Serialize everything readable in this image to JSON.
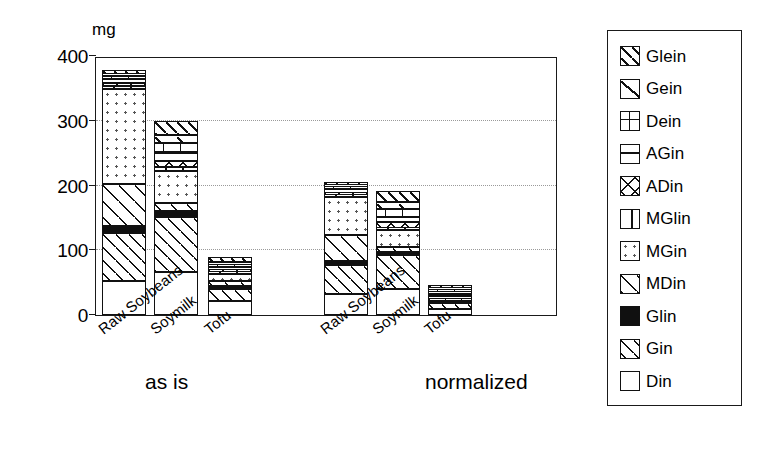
{
  "chart_data": {
    "type": "bar",
    "subtype": "stacked",
    "title": "",
    "xlabel": "",
    "ylabel": "mg",
    "ylim": [
      0,
      400
    ],
    "yticks": [
      0,
      100,
      200,
      300,
      400
    ],
    "ytick_labels": [
      "0",
      "100",
      "200",
      "300",
      "400"
    ],
    "grid": "horizontal-dotted",
    "legend_position": "right-outside",
    "groups": [
      {
        "label": "as is",
        "categories": [
          "Raw Soybeans",
          "Soymilk",
          "Tofu"
        ]
      },
      {
        "label": "normalized",
        "categories": [
          "Raw Soybeans",
          "Soymilk",
          "Tofu"
        ]
      }
    ],
    "categories": [
      "Raw Soybeans",
      "Soymilk",
      "Tofu",
      "Raw Soybeans",
      "Soymilk",
      "Tofu"
    ],
    "series": [
      {
        "name": "Din",
        "pattern": "blank",
        "values": [
          53,
          66,
          22,
          32,
          40,
          10
        ]
      },
      {
        "name": "Gin",
        "pattern": "diagonal-hatch-fine",
        "values": [
          73,
          86,
          18,
          45,
          52,
          8
        ]
      },
      {
        "name": "Glin",
        "pattern": "solid-black",
        "values": [
          11,
          9,
          5,
          7,
          6,
          3
        ]
      },
      {
        "name": "MDin",
        "pattern": "diagonal-hatch",
        "values": [
          66,
          12,
          7,
          40,
          7,
          4
        ]
      },
      {
        "name": "MGin",
        "pattern": "dotted",
        "values": [
          146,
          49,
          12,
          58,
          26,
          5
        ]
      },
      {
        "name": "MGlin",
        "pattern": "vertical-bar",
        "values": [
          5,
          6,
          2,
          3,
          4,
          1
        ]
      },
      {
        "name": "ADin",
        "pattern": "cross-diagonal",
        "values": [
          4,
          10,
          3,
          4,
          8,
          2
        ]
      },
      {
        "name": "AGin",
        "pattern": "horizontal-lines",
        "values": [
          6,
          12,
          5,
          5,
          9,
          3
        ]
      },
      {
        "name": "Dein",
        "pattern": "grid",
        "values": [
          5,
          16,
          4,
          4,
          12,
          3
        ]
      },
      {
        "name": "Gein",
        "pattern": "single-diagonal",
        "values": [
          3,
          12,
          4,
          3,
          10,
          3
        ]
      },
      {
        "name": "Glein",
        "pattern": "diagonal-hatch-bold",
        "values": [
          6,
          22,
          7,
          5,
          17,
          5
        ]
      }
    ],
    "totals": [
      378,
      300,
      89,
      206,
      191,
      47
    ]
  },
  "axes": {
    "unit_label": "mg",
    "ytick_labels": [
      "400",
      "300",
      "200",
      "100",
      "0"
    ]
  },
  "xaxis": {
    "tick_labels": [
      "Raw Soybeans",
      "Soymilk",
      "Tofu",
      "Raw Soybeans",
      "Soymilk",
      "Tofu"
    ],
    "group_labels": [
      "as is",
      "normalized"
    ]
  },
  "legend": {
    "entries": [
      {
        "label": "Glein",
        "swatch": "diagonal-hatch-bold-swatch"
      },
      {
        "label": "Gein",
        "swatch": "single-diagonal-swatch"
      },
      {
        "label": "Dein",
        "swatch": "grid-swatch"
      },
      {
        "label": "AGin",
        "swatch": "horizontal-lines-swatch"
      },
      {
        "label": "ADin",
        "swatch": "cross-diagonal-swatch"
      },
      {
        "label": "MGlin",
        "swatch": "vertical-bar-swatch"
      },
      {
        "label": "MGin",
        "swatch": "dotted-swatch"
      },
      {
        "label": "MDin",
        "swatch": "diagonal-hatch-swatch"
      },
      {
        "label": "Glin",
        "swatch": "solid-black-swatch"
      },
      {
        "label": "Gin",
        "swatch": "diagonal-hatch-fine-swatch"
      },
      {
        "label": "Din",
        "swatch": "blank-swatch"
      }
    ]
  },
  "colors": {
    "ink": "#111111",
    "frame": "#1a1a1a",
    "grid": "#9a9a9a",
    "background": "#ffffff"
  }
}
